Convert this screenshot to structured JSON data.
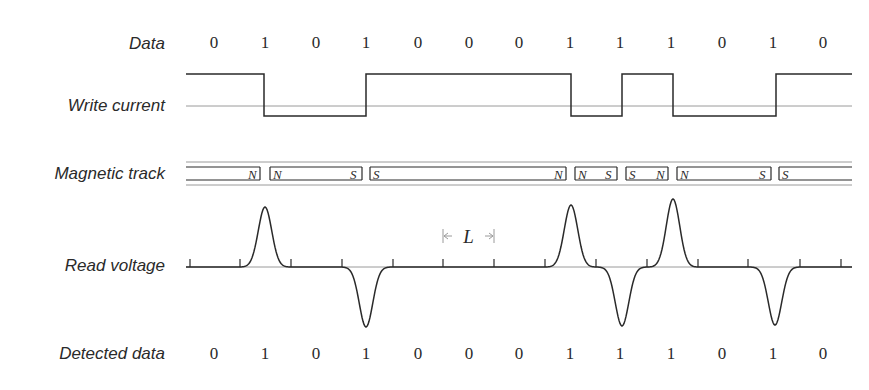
{
  "labels": {
    "data": "Data",
    "write_current": "Write current",
    "magnetic_track": "Magnetic track",
    "read_voltage": "Read voltage",
    "detected_data": "Detected data"
  },
  "bit_x": [
    214,
    265,
    316,
    366,
    418,
    469,
    519,
    570,
    620,
    671,
    722,
    773,
    823
  ],
  "data_bits": [
    "0",
    "1",
    "0",
    "1",
    "0",
    "0",
    "0",
    "1",
    "1",
    "1",
    "0",
    "1",
    "0"
  ],
  "detected_bits": [
    "0",
    "1",
    "0",
    "1",
    "0",
    "0",
    "0",
    "1",
    "1",
    "1",
    "0",
    "1",
    "0"
  ],
  "write_current": {
    "x_start": 186,
    "x_end": 852,
    "high_y": 74,
    "low_y": 116,
    "mid_y": 106,
    "initial_level": "high",
    "transitions_x": [
      264,
      366,
      571,
      622,
      673,
      776
    ]
  },
  "magnetic_track": {
    "segments": [
      {
        "x1": 186,
        "x2": 260,
        "left": "",
        "right": "N"
      },
      {
        "x1": 270,
        "x2": 362,
        "left": "N",
        "right": "S"
      },
      {
        "x1": 370,
        "x2": 566,
        "left": "S",
        "right": "N"
      },
      {
        "x1": 575,
        "x2": 617,
        "left": "N",
        "right": "S"
      },
      {
        "x1": 626,
        "x2": 668,
        "left": "S",
        "right": "N"
      },
      {
        "x1": 677,
        "x2": 771,
        "left": "N",
        "right": "S"
      },
      {
        "x1": 779,
        "x2": 852,
        "left": "S",
        "right": ""
      }
    ]
  },
  "read_voltage": {
    "baseline_y": 267,
    "ticks_x": [
      190,
      240,
      291,
      342,
      393,
      443,
      494,
      545,
      596,
      647,
      698,
      748,
      800,
      841
    ],
    "pulses": [
      {
        "x": 265,
        "peak_y": 207
      },
      {
        "x": 366,
        "peak_y": 327
      },
      {
        "x": 571,
        "peak_y": 205
      },
      {
        "x": 622,
        "peak_y": 326
      },
      {
        "x": 673,
        "peak_y": 199
      },
      {
        "x": 775,
        "peak_y": 325
      }
    ],
    "spacing_label": "L",
    "spacing_from_x": 443,
    "spacing_to_x": 494
  },
  "colors": {
    "ink": "#2a2a2a",
    "guide": "#9a9a9a"
  }
}
